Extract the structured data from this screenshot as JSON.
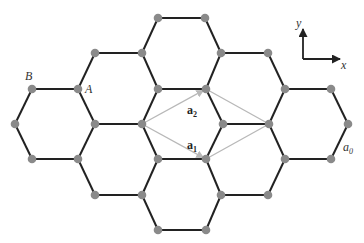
{
  "diagram": {
    "colors": {
      "edge": "#222222",
      "node": "#8a8a8a",
      "vector": "#b8b8b8",
      "axis": "#222222"
    },
    "labels": {
      "B": {
        "text": "B",
        "x": 25,
        "y": 80
      },
      "A": {
        "text": "A",
        "x": 85,
        "y": 93
      },
      "a0": {
        "text": "a",
        "sub": "0",
        "x": 343,
        "y": 151
      },
      "a1": {
        "text": "a",
        "sub": "1",
        "x": 187,
        "y": 149
      },
      "a2": {
        "text": "a",
        "sub": "2",
        "x": 187,
        "y": 114
      },
      "axis_x": {
        "text": "x",
        "x": 341,
        "y": 69
      },
      "axis_y": {
        "text": "y",
        "x": 296,
        "y": 27
      }
    },
    "axes": {
      "origin": [
        303,
        59
      ],
      "x_end": [
        340,
        59
      ],
      "y_end": [
        303,
        29
      ]
    },
    "nodes": [
      [
        158,
        18
      ],
      [
        205,
        18
      ],
      [
        95,
        53
      ],
      [
        142,
        53
      ],
      [
        221,
        53
      ],
      [
        268,
        53
      ],
      [
        32,
        89
      ],
      [
        78,
        89
      ],
      [
        158,
        89
      ],
      [
        206,
        89
      ],
      [
        285,
        89
      ],
      [
        331,
        89
      ],
      [
        15,
        124
      ],
      [
        95,
        124
      ],
      [
        142,
        124
      ],
      [
        223,
        124
      ],
      [
        269,
        124
      ],
      [
        348,
        124
      ],
      [
        32,
        159
      ],
      [
        78,
        159
      ],
      [
        158,
        159
      ],
      [
        206,
        159
      ],
      [
        285,
        159
      ],
      [
        331,
        159
      ],
      [
        95,
        195
      ],
      [
        142,
        195
      ],
      [
        221,
        195
      ],
      [
        268,
        195
      ],
      [
        158,
        230
      ],
      [
        206,
        230
      ]
    ],
    "edges": [
      [
        [
          158,
          18
        ],
        [
          205,
          18
        ]
      ],
      [
        [
          158,
          18
        ],
        [
          142,
          53
        ]
      ],
      [
        [
          205,
          18
        ],
        [
          221,
          53
        ]
      ],
      [
        [
          95,
          53
        ],
        [
          142,
          53
        ]
      ],
      [
        [
          221,
          53
        ],
        [
          268,
          53
        ]
      ],
      [
        [
          95,
          53
        ],
        [
          78,
          89
        ]
      ],
      [
        [
          142,
          53
        ],
        [
          158,
          89
        ]
      ],
      [
        [
          221,
          53
        ],
        [
          206,
          89
        ]
      ],
      [
        [
          268,
          53
        ],
        [
          285,
          89
        ]
      ],
      [
        [
          32,
          89
        ],
        [
          78,
          89
        ]
      ],
      [
        [
          158,
          89
        ],
        [
          206,
          89
        ]
      ],
      [
        [
          285,
          89
        ],
        [
          331,
          89
        ]
      ],
      [
        [
          32,
          89
        ],
        [
          15,
          124
        ]
      ],
      [
        [
          78,
          89
        ],
        [
          95,
          124
        ]
      ],
      [
        [
          158,
          89
        ],
        [
          142,
          124
        ]
      ],
      [
        [
          206,
          89
        ],
        [
          223,
          124
        ]
      ],
      [
        [
          285,
          89
        ],
        [
          269,
          124
        ]
      ],
      [
        [
          331,
          89
        ],
        [
          348,
          124
        ]
      ],
      [
        [
          95,
          124
        ],
        [
          142,
          124
        ]
      ],
      [
        [
          223,
          124
        ],
        [
          269,
          124
        ]
      ],
      [
        [
          15,
          124
        ],
        [
          32,
          159
        ]
      ],
      [
        [
          95,
          124
        ],
        [
          78,
          159
        ]
      ],
      [
        [
          142,
          124
        ],
        [
          158,
          159
        ]
      ],
      [
        [
          223,
          124
        ],
        [
          206,
          159
        ]
      ],
      [
        [
          269,
          124
        ],
        [
          285,
          159
        ]
      ],
      [
        [
          348,
          124
        ],
        [
          331,
          159
        ]
      ],
      [
        [
          32,
          159
        ],
        [
          78,
          159
        ]
      ],
      [
        [
          158,
          159
        ],
        [
          206,
          159
        ]
      ],
      [
        [
          285,
          159
        ],
        [
          331,
          159
        ]
      ],
      [
        [
          78,
          159
        ],
        [
          95,
          195
        ]
      ],
      [
        [
          158,
          159
        ],
        [
          142,
          195
        ]
      ],
      [
        [
          206,
          159
        ],
        [
          221,
          195
        ]
      ],
      [
        [
          285,
          159
        ],
        [
          268,
          195
        ]
      ],
      [
        [
          95,
          195
        ],
        [
          142,
          195
        ]
      ],
      [
        [
          221,
          195
        ],
        [
          268,
          195
        ]
      ],
      [
        [
          142,
          195
        ],
        [
          158,
          230
        ]
      ],
      [
        [
          221,
          195
        ],
        [
          206,
          230
        ]
      ],
      [
        [
          158,
          230
        ],
        [
          206,
          230
        ]
      ]
    ],
    "vectors": [
      {
        "name": "a1",
        "from": [
          142,
          124
        ],
        "to": [
          206,
          159
        ],
        "arrow": true
      },
      {
        "name": "a2",
        "from": [
          142,
          124
        ],
        "to": [
          206,
          89
        ],
        "arrow": true
      },
      {
        "name": "cell-upper",
        "from": [
          206,
          89
        ],
        "to": [
          269,
          124
        ],
        "arrow": false
      },
      {
        "name": "cell-lower",
        "from": [
          206,
          159
        ],
        "to": [
          269,
          124
        ],
        "arrow": false
      }
    ]
  }
}
